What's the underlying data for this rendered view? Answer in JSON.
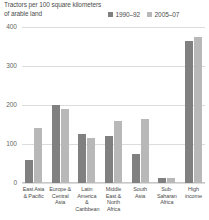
{
  "chart_data": {
    "type": "bar",
    "title": "Tractors per 100 square kilometers of arable land",
    "xlabel": "",
    "ylabel": "",
    "ylim": [
      0,
      400
    ],
    "yticks": [
      0,
      100,
      200,
      300,
      400
    ],
    "ytick_labels": [
      "0",
      "100",
      "200",
      "300",
      "400"
    ],
    "grid": true,
    "legend_position": "top-right",
    "categories": [
      "East Asia & Pacific",
      "Europe & Central Asia",
      "Latin America & Caribbean",
      "Middle East & North Africa",
      "South Asia",
      "Sub-Saharan Africa",
      "High income"
    ],
    "series": [
      {
        "name": "1990–92",
        "color": "#808080",
        "values": [
          60,
          200,
          125,
          120,
          75,
          13,
          365
        ]
      },
      {
        "name": "2005–07",
        "color": "#b8b8b8",
        "values": [
          140,
          190,
          115,
          160,
          165,
          12,
          375
        ]
      }
    ]
  },
  "colors": {
    "series_1990_92": "#808080",
    "series_2005_07": "#b8b8b8",
    "gridline": "#dcdcdc",
    "text": "#4d4d4d",
    "tick_text": "#666666",
    "background": "#ffffff"
  }
}
